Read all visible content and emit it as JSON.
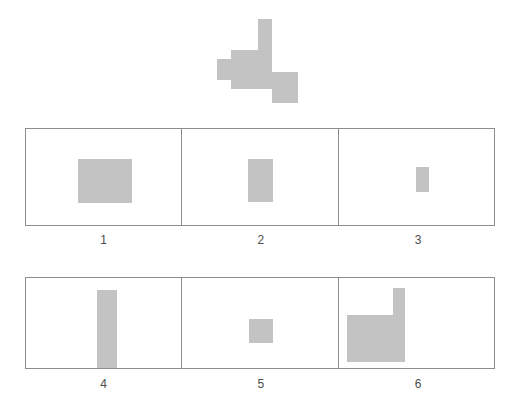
{
  "puzzle": {
    "type": "shape-matching",
    "fill_color": "#c3c3c3",
    "border_color": "#8d8d8d",
    "background_color": "#ffffff",
    "label_color": "#4c4c4c"
  },
  "target": {
    "name": "target-shape",
    "description": "irregular stepped polygon",
    "points": "41,0 55,0 55,53 81,53 81,84 55,84 55,70 14,70 14,61 0,61 0,40 14,40 14,31 41,31"
  },
  "options": [
    {
      "number": "1",
      "shape": "rectangle",
      "x": 52,
      "y": 30,
      "width": 54,
      "height": 44
    },
    {
      "number": "2",
      "shape": "rectangle",
      "x": 66,
      "y": 30,
      "width": 25,
      "height": 43
    },
    {
      "number": "3",
      "shape": "rectangle",
      "x": 77,
      "y": 38,
      "width": 13,
      "height": 25
    },
    {
      "number": "4",
      "shape": "rectangle",
      "x": 71,
      "y": 12,
      "width": 20,
      "height": 78
    },
    {
      "number": "5",
      "shape": "rectangle",
      "x": 67,
      "y": 41,
      "width": 24,
      "height": 24
    },
    {
      "number": "6",
      "shape": "L-polygon",
      "x": 8,
      "y": 10,
      "width": 58,
      "height": 74,
      "points": "46,0 58,0 58,74 0,74 0,27 46,27"
    }
  ]
}
